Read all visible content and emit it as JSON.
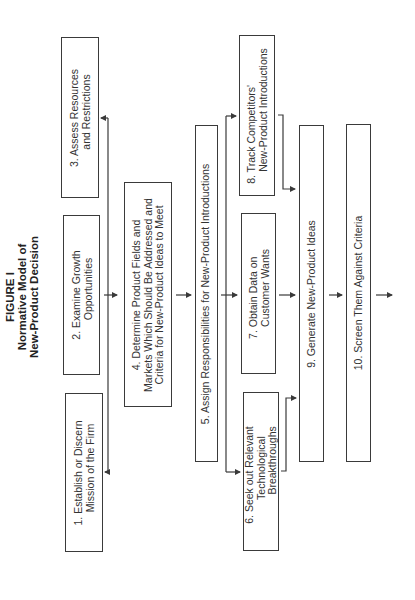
{
  "title": {
    "line1": "FIGURE I",
    "line2": "Normative Model of",
    "line3": "New-Product Decision"
  },
  "boxes": [
    {
      "id": 1,
      "lines": [
        "1.  Establish or Discern",
        "Mission of the Firm"
      ]
    },
    {
      "id": 2,
      "lines": [
        "2.  Examine Growth",
        "Opportunities"
      ]
    },
    {
      "id": 3,
      "lines": [
        "3.  Assess Resources",
        "and Restrictions"
      ]
    },
    {
      "id": 4,
      "lines": [
        "4.  Determine Product Fields and",
        "Markets Which Should Be Addressed and",
        "Criteria for New-Product Ideas to Meet"
      ]
    },
    {
      "id": 5,
      "lines": [
        "5.  Assign Responsibilities for New-Product Introductions"
      ]
    },
    {
      "id": 6,
      "lines": [
        "6.  Seek out Relevant",
        "Technological",
        "Breakthroughs"
      ]
    },
    {
      "id": 7,
      "lines": [
        "7.  Obtain Data on",
        "Customer Wants"
      ]
    },
    {
      "id": 8,
      "lines": [
        "8.  Track Competitors'",
        "New-Product Introductions"
      ]
    },
    {
      "id": 9,
      "lines": [
        "9.  Generate New-Product Ideas"
      ]
    },
    {
      "id": 10,
      "lines": [
        "10.  Screen Them Against Criteria"
      ]
    }
  ],
  "colors": {
    "line": "#3a3a3a",
    "background": "#ffffff"
  }
}
